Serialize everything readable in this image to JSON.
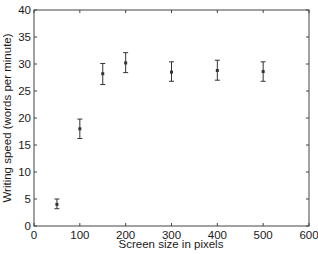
{
  "chart_data": {
    "type": "scatter",
    "title": "",
    "xlabel": "Screen size in pixels",
    "ylabel": "Writing speed (words per minute)",
    "xlim": [
      0,
      600
    ],
    "ylim": [
      0,
      40
    ],
    "xticks": [
      0,
      100,
      200,
      300,
      400,
      500,
      600
    ],
    "yticks": [
      0,
      5,
      10,
      15,
      20,
      25,
      30,
      35,
      40
    ],
    "grid": false,
    "legend": null,
    "series": [
      {
        "name": "Writing speed",
        "marker": "square",
        "error_bars": true,
        "x": [
          50,
          100,
          150,
          200,
          300,
          400,
          500
        ],
        "y": [
          4.0,
          18.0,
          28.2,
          30.2,
          28.5,
          28.8,
          28.6
        ],
        "yerr_low": [
          3.2,
          16.2,
          26.2,
          28.4,
          26.8,
          27.0,
          26.8
        ],
        "yerr_high": [
          5.0,
          19.8,
          30.1,
          32.1,
          30.4,
          30.7,
          30.4
        ]
      }
    ]
  },
  "colors": {
    "axis": "#444444",
    "marker": "#333333",
    "text": "#1a1a1a"
  }
}
